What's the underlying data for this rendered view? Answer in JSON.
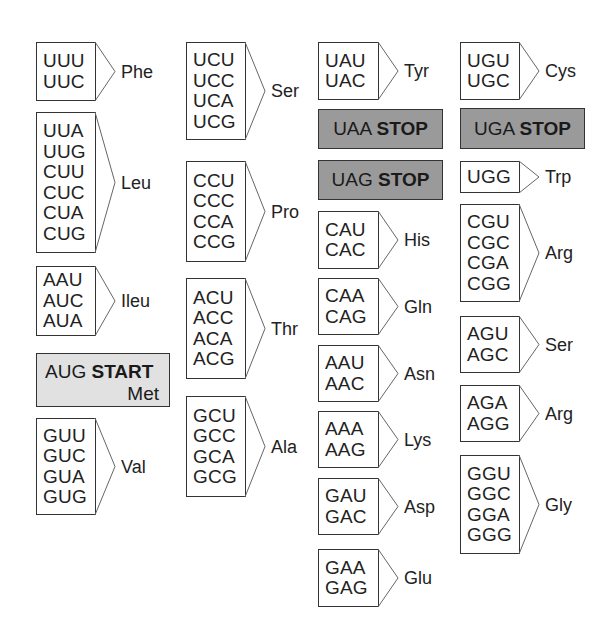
{
  "diagram": {
    "type": "genetic-code-table",
    "colors": {
      "box_border": "#333333",
      "start_fill": "#e1e1e1",
      "stop_fill": "#9a9a9a",
      "background": "#ffffff"
    },
    "columns": [
      {
        "groups": [
          {
            "codons": [
              "UUU",
              "UUC"
            ],
            "amino_acid": "Phe"
          },
          {
            "codons": [
              "UUA",
              "UUG",
              "CUU",
              "CUC",
              "CUA",
              "CUG"
            ],
            "amino_acid": "Leu"
          },
          {
            "codons": [
              "AAU",
              "AUC",
              "AUA"
            ],
            "amino_acid": "Ileu"
          },
          {
            "special": "start",
            "codon": "AUG",
            "label": "START",
            "amino_acid": "Met"
          },
          {
            "codons": [
              "GUU",
              "GUC",
              "GUA",
              "GUG"
            ],
            "amino_acid": "Val"
          }
        ]
      },
      {
        "groups": [
          {
            "codons": [
              "UCU",
              "UCC",
              "UCA",
              "UCG"
            ],
            "amino_acid": "Ser"
          },
          {
            "codons": [
              "CCU",
              "CCC",
              "CCA",
              "CCG"
            ],
            "amino_acid": "Pro"
          },
          {
            "codons": [
              "ACU",
              "ACC",
              "ACA",
              "ACG"
            ],
            "amino_acid": "Thr"
          },
          {
            "codons": [
              "GCU",
              "GCC",
              "GCA",
              "GCG"
            ],
            "amino_acid": "Ala"
          }
        ]
      },
      {
        "groups": [
          {
            "codons": [
              "UAU",
              "UAC"
            ],
            "amino_acid": "Tyr"
          },
          {
            "special": "stop",
            "codon": "UAA",
            "label": "STOP"
          },
          {
            "special": "stop",
            "codon": "UAG",
            "label": "STOP"
          },
          {
            "codons": [
              "CAU",
              "CAC"
            ],
            "amino_acid": "His"
          },
          {
            "codons": [
              "CAA",
              "CAG"
            ],
            "amino_acid": "Gln"
          },
          {
            "codons": [
              "AAU",
              "AAC"
            ],
            "amino_acid": "Asn"
          },
          {
            "codons": [
              "AAA",
              "AAG"
            ],
            "amino_acid": "Lys"
          },
          {
            "codons": [
              "GAU",
              "GAC"
            ],
            "amino_acid": "Asp"
          },
          {
            "codons": [
              "GAA",
              "GAG"
            ],
            "amino_acid": "Glu"
          }
        ]
      },
      {
        "groups": [
          {
            "codons": [
              "UGU",
              "UGC"
            ],
            "amino_acid": "Cys"
          },
          {
            "special": "stop",
            "codon": "UGA",
            "label": "STOP"
          },
          {
            "codons": [
              "UGG"
            ],
            "amino_acid": "Trp"
          },
          {
            "codons": [
              "CGU",
              "CGC",
              "CGA",
              "CGG"
            ],
            "amino_acid": "Arg"
          },
          {
            "codons": [
              "AGU",
              "AGC"
            ],
            "amino_acid": "Ser"
          },
          {
            "codons": [
              "AGA",
              "AGG"
            ],
            "amino_acid": "Arg"
          },
          {
            "codons": [
              "GGU",
              "GGC",
              "GGA",
              "GGG"
            ],
            "amino_acid": "Gly"
          }
        ]
      }
    ]
  }
}
